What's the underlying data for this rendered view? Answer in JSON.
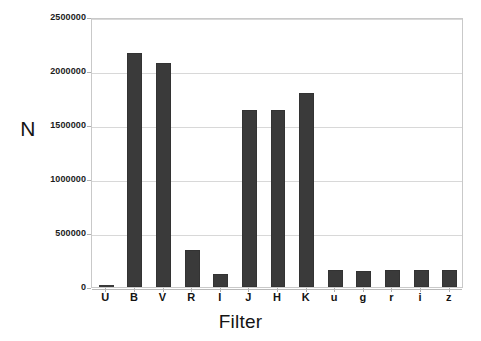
{
  "chart_data": {
    "type": "bar",
    "title": "",
    "subtitle": "",
    "xlabel": "Filter",
    "ylabel": "N",
    "categories": [
      "U",
      "B",
      "V",
      "R",
      "I",
      "J",
      "H",
      "K",
      "u",
      "g",
      "r",
      "i",
      "z"
    ],
    "values": [
      10000,
      2170000,
      2070000,
      345000,
      120000,
      1640000,
      1635000,
      1800000,
      155000,
      150000,
      155000,
      155000,
      160000
    ],
    "series": [
      {
        "name": "N",
        "values": [
          10000,
          2170000,
          2070000,
          345000,
          120000,
          1640000,
          1635000,
          1800000,
          155000,
          150000,
          155000,
          155000,
          160000
        ]
      }
    ],
    "ylim": [
      0,
      2500000
    ],
    "yticks": [
      0,
      500000,
      1000000,
      1500000,
      2000000,
      2500000
    ],
    "ytick_labels": [
      "0",
      "500000",
      "1000000",
      "1500000",
      "2000000",
      "2500000"
    ],
    "grid": true,
    "grid_axis": "y",
    "legend": false,
    "legend_position": "none",
    "bar_color": "#3a3a3a",
    "grid_color": "#d8d8d8",
    "frame_color": "#c9c9c9",
    "background_color": "#ffffff"
  }
}
